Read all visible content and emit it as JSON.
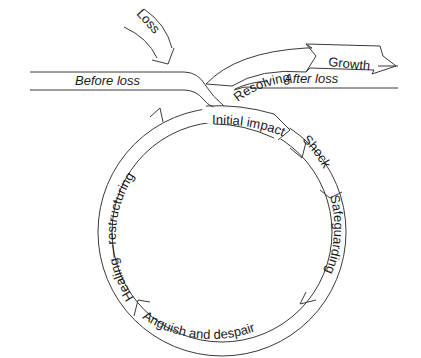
{
  "diagram": {
    "type": "grief-cycle",
    "stages": {
      "loss": "Loss",
      "before_loss": "Before loss",
      "initial_impact": "Initial impact",
      "shock": "Shock",
      "safeguarding": "Safeguarding",
      "anguish": "Anguish and despair",
      "healing": "Healing—restructuring",
      "resolving": "Resolving",
      "growth": "Growth",
      "after_loss": "After loss"
    },
    "colors": {
      "line": "#3a3a3a",
      "text": "#1a1a1a",
      "background": "#ffffff"
    }
  }
}
